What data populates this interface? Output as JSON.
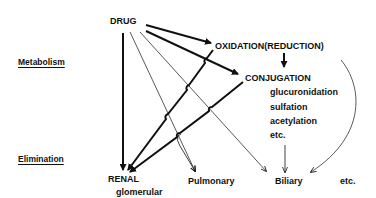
{
  "sections": {
    "metabolism": "Metabolism",
    "elimination": "Elimination"
  },
  "nodes": {
    "drug": "DRUG",
    "oxidation": "OXIDATION(REDUCTION)",
    "conjugation": "CONJUGATION",
    "conjugation_types": [
      "glucuronidation",
      "sulfation",
      "acetylation",
      "etc."
    ],
    "renal": "RENAL",
    "renal_sub": "glomerular",
    "pulmonary": "Pulmonary",
    "biliary": "Biliary",
    "other": "etc."
  },
  "colors": {
    "ink": "#111111",
    "background": "#ffffff"
  }
}
